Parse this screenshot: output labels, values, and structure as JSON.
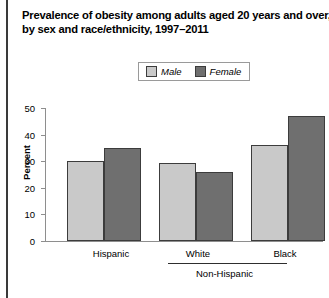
{
  "chart_data": {
    "type": "bar",
    "title": "Prevalence of obesity among adults aged 20 years and over, by sex and race/ethnicity, 1997–2011",
    "title_lines": [
      "Prevalence of obesity among adults aged 20 years and over,",
      "by sex and race/ethnicity, 1997–2011"
    ],
    "categories": [
      "Hispanic",
      "White",
      "Black"
    ],
    "group_bracket": {
      "label": "Non-Hispanic",
      "covers": [
        "White",
        "Black"
      ]
    },
    "series": [
      {
        "name": "Male",
        "values": [
          30,
          29.5,
          36
        ],
        "color": "#c9c9c9"
      },
      {
        "name": "Female",
        "values": [
          35,
          26,
          47
        ],
        "color": "#6f6f6f"
      }
    ],
    "xlabel": "",
    "ylabel": "Percent",
    "ylim": [
      0,
      50
    ],
    "yticks": [
      0,
      10,
      20,
      30,
      40,
      50
    ],
    "ytick_labels": [
      "0",
      "10",
      "20",
      "30",
      "40",
      "50"
    ],
    "grid": false,
    "legend_position": "top-center"
  },
  "legend": {
    "items": [
      {
        "label": "Male",
        "swatch": "legend-swatch-male"
      },
      {
        "label": "Female",
        "swatch": "legend-swatch-female"
      }
    ]
  },
  "footer": {
    "note": ""
  }
}
